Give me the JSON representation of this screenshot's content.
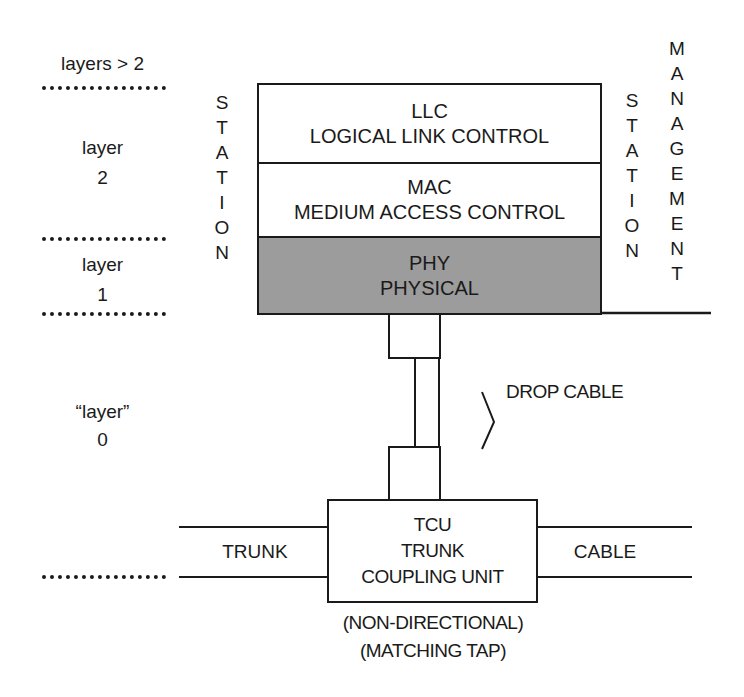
{
  "left_labels": {
    "layers_gt2": "layers > 2",
    "layer2": [
      "layer",
      "2"
    ],
    "layer1": [
      "layer",
      "1"
    ],
    "layer0": [
      "“layer”",
      "0"
    ]
  },
  "station_left": [
    "S",
    "T",
    "A",
    "T",
    "I",
    "O",
    "N"
  ],
  "station_right": [
    "S",
    "T",
    "A",
    "T",
    "I",
    "O",
    "N"
  ],
  "management": [
    "M",
    "A",
    "N",
    "A",
    "G",
    "E",
    "M",
    "E",
    "N",
    "T"
  ],
  "stack": {
    "llc": {
      "abbr": "LLC",
      "name": "LOGICAL LINK CONTROL"
    },
    "mac": {
      "abbr": "MAC",
      "name": "MEDIUM ACCESS CONTROL"
    },
    "phy": {
      "abbr": "PHY",
      "name": "PHYSICAL",
      "fill": "#9c9c9c"
    }
  },
  "drop_cable": "DROP CABLE",
  "tcu": {
    "lines": [
      "TCU",
      "TRUNK",
      "COUPLING UNIT"
    ]
  },
  "trunk_label": "TRUNK",
  "cable_label": "CABLE",
  "tcu_notes": [
    "(NON-DIRECTIONAL)",
    "(MATCHING TAP)"
  ],
  "colors": {
    "ink": "#1a1a1a",
    "phy_fill": "#9c9c9c",
    "background": "#ffffff"
  }
}
